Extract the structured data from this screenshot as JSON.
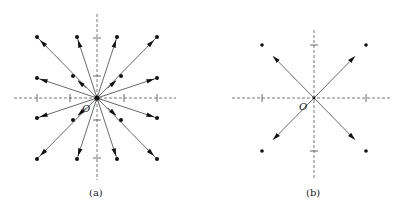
{
  "figure": {
    "panels": [
      {
        "id": "a",
        "caption": "(a)",
        "origin_label": "O",
        "description": "Lattice of points with displacement vectors pointing radially outward from origin O",
        "grid_points": [
          [
            -2,
            2
          ],
          [
            -1,
            2
          ],
          [
            1,
            2
          ],
          [
            2,
            2
          ],
          [
            -2,
            1
          ],
          [
            2,
            1
          ],
          [
            -2,
            -1
          ],
          [
            2,
            -1
          ],
          [
            -2,
            -2
          ],
          [
            -1,
            -2
          ],
          [
            1,
            -2
          ],
          [
            2,
            -2
          ]
        ],
        "inner_points": [
          [
            -0.8,
            0.73
          ],
          [
            0.8,
            0.73
          ],
          [
            -0.8,
            -0.73
          ],
          [
            0.8,
            -0.73
          ]
        ],
        "arrow_direction": "outward",
        "ticks": [
          -2,
          -1,
          1,
          2
        ]
      },
      {
        "id": "b",
        "caption": "(b)",
        "origin_label": "O",
        "description": "Four corner points with vectors from origin along diagonals",
        "grid_points": [
          [
            -1,
            1
          ],
          [
            1,
            1
          ],
          [
            -1,
            -1
          ],
          [
            1,
            -1
          ]
        ],
        "arrow_direction": "outward",
        "ticks": [
          -1,
          1
        ]
      }
    ]
  }
}
